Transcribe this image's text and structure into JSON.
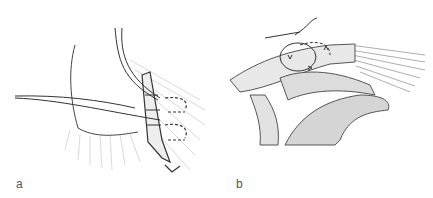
{
  "figure": {
    "panels": [
      {
        "label": "a",
        "description": "Suture repair illustration with graft strip and dashed suture loops"
      },
      {
        "label": "b",
        "description": "Shoulder anatomy illustration with suture loops around clavicle/acromion"
      }
    ],
    "colors": {
      "background": "#ffffff",
      "line": "#333333",
      "shade": "#bdbdbd",
      "bone": "#e6e6e6"
    }
  }
}
